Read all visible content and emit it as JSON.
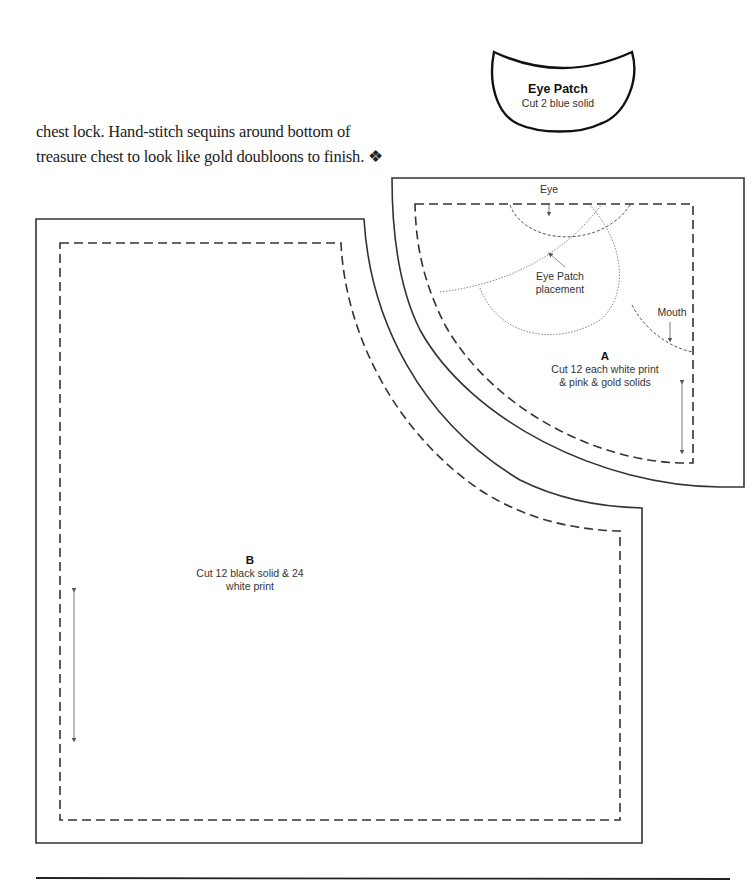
{
  "document": {
    "paragraph_lines": [
      "chest lock. Hand-stitch sequins around bottom of",
      "treasure chest to look like gold doubloons to finish."
    ],
    "end_mark": "❖"
  },
  "pieces": {
    "eye_patch": {
      "title": "Eye Patch",
      "instruction": "Cut 2 blue solid"
    },
    "piece_a": {
      "title": "A",
      "instruction_line1": "Cut 12 each white print",
      "instruction_line2": "& pink & gold solids",
      "markings": {
        "eye": "Eye",
        "eye_patch_placement_line1": "Eye Patch",
        "eye_patch_placement_line2": "placement",
        "mouth": "Mouth"
      }
    },
    "piece_b": {
      "title": "B",
      "instruction_line1": "Cut 12 black solid & 24",
      "instruction_line2": "white print"
    }
  },
  "colors": {
    "line": "#333333",
    "guide": "#888888",
    "text": "#333333"
  }
}
